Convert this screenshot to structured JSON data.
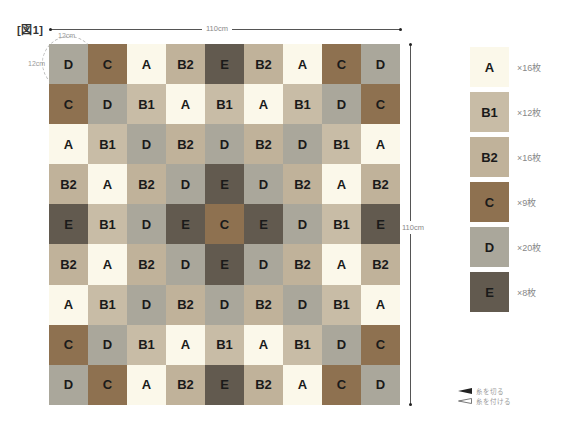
{
  "figure": {
    "label": "[図1]",
    "width_label": "110cm",
    "height_label": "110cm",
    "cell_width_label": "12cm",
    "cell_height_label": "12cm"
  },
  "colors": {
    "A": "#fbf8ea",
    "B1": "#c8bca6",
    "B2": "#c0b29a",
    "C": "#8e7150",
    "D": "#aaa79b",
    "E": "#625a4f"
  },
  "grid": {
    "rows": [
      [
        "D",
        "C",
        "A",
        "B2",
        "E",
        "B2",
        "A",
        "C",
        "D"
      ],
      [
        "C",
        "D",
        "B1",
        "A",
        "B1",
        "A",
        "B1",
        "D",
        "C"
      ],
      [
        "A",
        "B1",
        "D",
        "B2",
        "D",
        "B2",
        "D",
        "B1",
        "A"
      ],
      [
        "B2",
        "A",
        "B2",
        "D",
        "E",
        "D",
        "B2",
        "A",
        "B2"
      ],
      [
        "E",
        "B1",
        "D",
        "E",
        "C",
        "E",
        "D",
        "B1",
        "E"
      ],
      [
        "B2",
        "A",
        "B2",
        "D",
        "E",
        "D",
        "B2",
        "A",
        "B2"
      ],
      [
        "A",
        "B1",
        "D",
        "B2",
        "D",
        "B2",
        "D",
        "B1",
        "A"
      ],
      [
        "C",
        "D",
        "B1",
        "A",
        "B1",
        "A",
        "B1",
        "D",
        "C"
      ],
      [
        "D",
        "C",
        "A",
        "B2",
        "E",
        "B2",
        "A",
        "C",
        "D"
      ]
    ]
  },
  "legend": [
    {
      "code": "A",
      "count": "×16枚"
    },
    {
      "code": "B1",
      "count": "×12枚"
    },
    {
      "code": "B2",
      "count": "×16枚"
    },
    {
      "code": "C",
      "count": "×9枚"
    },
    {
      "code": "D",
      "count": "×20枚"
    },
    {
      "code": "E",
      "count": "×8枚"
    }
  ],
  "key": {
    "cut_thread": "糸を切る",
    "attach_thread": "糸を付ける"
  }
}
